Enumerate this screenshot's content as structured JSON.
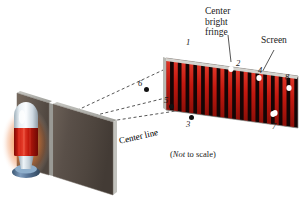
{
  "figure": {
    "type": "double-slit-interference-diagram",
    "background": "#ffffff",
    "note": "(Not to scale)",
    "note_italic_word": "Not",
    "note_rest": " to scale)",
    "note_open": "("
  },
  "labels": {
    "center_bright_fringe": [
      "Center",
      "bright",
      "fringe"
    ],
    "screen": "Screen",
    "center_line": "Center line"
  },
  "fringe_numbers": [
    {
      "id": "fringe-1",
      "text": "1",
      "x": 186,
      "y": 38
    },
    {
      "id": "fringe-2",
      "text": "2",
      "x": 236,
      "y": 59
    },
    {
      "id": "fringe-4",
      "text": "4",
      "x": 258,
      "y": 66
    },
    {
      "id": "fringe-8",
      "text": "8",
      "x": 285,
      "y": 73
    },
    {
      "id": "fringe-7",
      "text": "7",
      "x": 272,
      "y": 122
    }
  ],
  "ray_dots": [
    {
      "id": "ray-dot-6",
      "text": "6",
      "dot_x": 146,
      "dot_y": 89,
      "label_x": 138,
      "label_y": 79
    },
    {
      "id": "ray-dot-5",
      "text": "5",
      "dot_x": 171,
      "dot_y": 106,
      "label_x": 164,
      "label_y": 96
    },
    {
      "id": "ray-dot-3",
      "text": "3",
      "dot_x": 191,
      "dot_y": 117,
      "label_x": 186,
      "label_y": 120
    }
  ],
  "screen": {
    "name": "interference-screen",
    "bright_color": "#c4180f",
    "bright_color_light": "#e2392a",
    "dark_color": "#170606",
    "edge_color": "#b9b9b4",
    "band_count": 17,
    "fringe_spots": [
      {
        "name": "bright-spot-1",
        "x": 193,
        "y": 51
      },
      {
        "name": "bright-spot-2",
        "x": 231,
        "y": 69
      },
      {
        "name": "bright-spot-4",
        "x": 259,
        "y": 78
      },
      {
        "name": "bright-spot-8",
        "x": 289,
        "y": 88
      },
      {
        "name": "bright-spot-7",
        "x": 275,
        "y": 113
      },
      {
        "name": "bright-spot-lower",
        "x": 273,
        "y": 114
      }
    ]
  },
  "barrier": {
    "name": "slit-barrier",
    "face_color": "#5d5349",
    "face_color_dark": "#4a423a",
    "top_color": "#a9a9a4",
    "edge_color": "#c9c9c4",
    "slit_color": "#8d8d88"
  },
  "light_source": {
    "name": "laser-light-source",
    "dome_color": "#e8eef2",
    "body_color": "#c0170d",
    "neck_color": "#dde6ec",
    "base_color": "#5d7fa8",
    "glow_color": "#f28b3c"
  },
  "rays": {
    "name": "light-rays",
    "stroke": "#2b2b2b",
    "dash": "3 2.5",
    "origin_x": 52,
    "origin_y": 122
  }
}
